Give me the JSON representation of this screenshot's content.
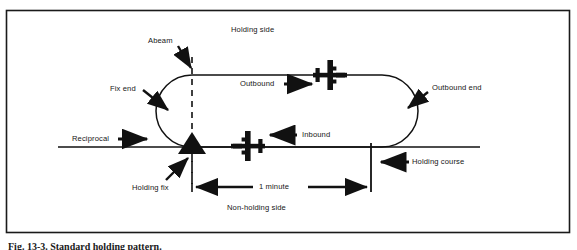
{
  "figure": {
    "caption": "Fig. 13-3. Standard holding pattern.",
    "border_color": "#1a1a1a",
    "ink_color": "#111111",
    "background": "#ffffff"
  },
  "diagram": {
    "type": "standard-holding-pattern",
    "title_labels": {
      "holding_side": "Holding side",
      "non_holding_side": "Non-holding side"
    },
    "callouts": [
      {
        "name": "abeam",
        "text": "Abeam",
        "x": 153,
        "y": 41,
        "arrow": "down-right"
      },
      {
        "name": "fix-end",
        "text": "Fix end",
        "x": 113,
        "y": 89,
        "arrow": "down-right"
      },
      {
        "name": "reciprocal",
        "text": "Reciprocal",
        "x": 75,
        "y": 139,
        "arrow": "right"
      },
      {
        "name": "holding-fix",
        "text": "Holding fix",
        "x": 135,
        "y": 188,
        "arrow": "up-right"
      },
      {
        "name": "outbound",
        "text": "Outbound",
        "x": 241,
        "y": 84,
        "arrow": "right"
      },
      {
        "name": "inbound",
        "text": "Inbound",
        "x": 301,
        "y": 135,
        "arrow": "left"
      },
      {
        "name": "outbound-end",
        "text": "Outbound end",
        "x": 433,
        "y": 88,
        "arrow": "down-left"
      },
      {
        "name": "holding-course",
        "text": "Holding course",
        "x": 413,
        "y": 162,
        "arrow": "left"
      },
      {
        "name": "one-minute",
        "text": "1 minute",
        "x": 276,
        "y": 183,
        "arrow": "both"
      }
    ],
    "dimension": {
      "label": "1 minute",
      "from_x": 190,
      "to_x": 370,
      "y": 187
    },
    "aircraft": [
      {
        "name": "outbound-aircraft",
        "heading": "east",
        "x": 330,
        "y": 75
      },
      {
        "name": "inbound-aircraft",
        "heading": "west",
        "x": 248,
        "y": 146
      }
    ],
    "fix_marker": {
      "name": "holding-fix-triangle",
      "x": 192,
      "y": 150
    },
    "racetrack": {
      "left_x": 192,
      "right_x": 418,
      "top_y": 75,
      "bottom_y": 147
    },
    "dashed_abeam_line": {
      "x": 192,
      "from_y": 57,
      "to_y": 190
    }
  }
}
